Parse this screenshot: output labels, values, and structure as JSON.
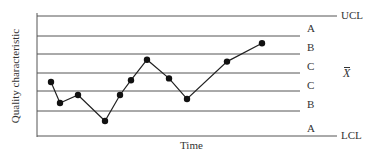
{
  "chart_data": {
    "type": "line",
    "title": "",
    "xlabel": "Time",
    "ylabel": "Quality characteristic",
    "control_limits": {
      "upper": "UCL",
      "center": "X̄",
      "lower": "LCL"
    },
    "zones_upper_to_lower": [
      "A",
      "B",
      "C",
      "C",
      "B",
      "A"
    ],
    "center_label": "X",
    "y_units": "sigma from center line (UCL = +3, LCL = -3)",
    "x": [
      1,
      2,
      3,
      4,
      5,
      6,
      7,
      8,
      9,
      10,
      11
    ],
    "values": [
      -0.5,
      -1.6,
      -1.2,
      -2.4,
      -1.2,
      -0.4,
      0.7,
      -0.3,
      -1.4,
      0.6,
      1.6
    ],
    "grid": true,
    "legend": "none"
  },
  "labels": {
    "ucl": "UCL",
    "lcl": "LCL",
    "xbar": "X",
    "zone_a_upper": "A",
    "zone_b_upper": "B",
    "zone_c_upper": "C",
    "zone_c_lower": "C",
    "zone_b_lower": "B",
    "zone_a_lower": "A",
    "xlabel": "Time",
    "ylabel": "Quality characteristic"
  }
}
